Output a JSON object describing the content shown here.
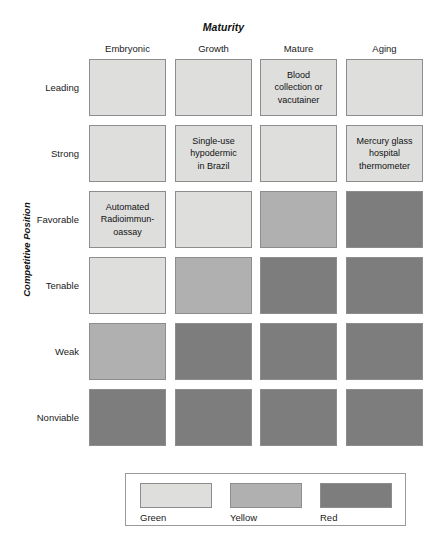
{
  "chart_data": {
    "type": "heatmap",
    "title": "Maturity",
    "xlabel": "Maturity",
    "ylabel": "Competitive Position",
    "categories": [
      "Embryonic",
      "Growth",
      "Mature",
      "Aging"
    ],
    "rows": [
      "Leading",
      "Strong",
      "Favorable",
      "Tenable",
      "Weak",
      "Nonviable"
    ],
    "legend_position": "bottom",
    "grid": false,
    "value_levels": [
      "Green",
      "Yellow",
      "Red"
    ],
    "level_colors": {
      "Green": "#dededd",
      "Yellow": "#b0b0b0",
      "Red": "#7d7d7d"
    },
    "cells": [
      [
        {
          "level": "Green",
          "label": ""
        },
        {
          "level": "Green",
          "label": ""
        },
        {
          "level": "Green",
          "label": "Blood\ncollection or\nvacutainer"
        },
        {
          "level": "Green",
          "label": ""
        }
      ],
      [
        {
          "level": "Green",
          "label": ""
        },
        {
          "level": "Green",
          "label": "Single-use\nhypodermic\nin Brazil"
        },
        {
          "level": "Green",
          "label": ""
        },
        {
          "level": "Green",
          "label": "Mercury glass\nhospital\nthermometer"
        }
      ],
      [
        {
          "level": "Green",
          "label": "Automated\nRadioimmun-\noassay"
        },
        {
          "level": "Green",
          "label": ""
        },
        {
          "level": "Yellow",
          "label": ""
        },
        {
          "level": "Red",
          "label": ""
        }
      ],
      [
        {
          "level": "Green",
          "label": ""
        },
        {
          "level": "Yellow",
          "label": ""
        },
        {
          "level": "Red",
          "label": ""
        },
        {
          "level": "Red",
          "label": ""
        }
      ],
      [
        {
          "level": "Yellow",
          "label": ""
        },
        {
          "level": "Red",
          "label": ""
        },
        {
          "level": "Red",
          "label": ""
        },
        {
          "level": "Red",
          "label": ""
        }
      ],
      [
        {
          "level": "Red",
          "label": ""
        },
        {
          "level": "Red",
          "label": ""
        },
        {
          "level": "Red",
          "label": ""
        },
        {
          "level": "Red",
          "label": ""
        }
      ]
    ],
    "legend": [
      {
        "label": "Green",
        "color": "#dededd"
      },
      {
        "label": "Yellow",
        "color": "#b0b0b0"
      },
      {
        "label": "Red",
        "color": "#7d7d7d"
      }
    ]
  }
}
